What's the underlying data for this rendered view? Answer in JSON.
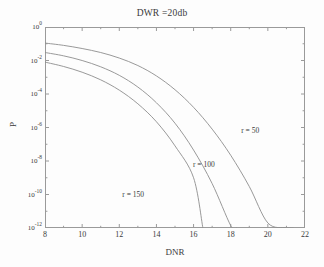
{
  "figure": {
    "title": "DWR =20db",
    "xlabel": "DNR",
    "ylabel": "P",
    "line_color": "#8d8d8d",
    "axis_color": "#9a9a9a",
    "text_color": "#3a3a3a",
    "background": "#fdfdfd"
  },
  "axis": {
    "x_ticks": [
      "8",
      "10",
      "12",
      "14",
      "16",
      "18",
      "20",
      "22"
    ],
    "y_ticks": [
      {
        "mantissa": "10",
        "exponent": "0"
      },
      {
        "mantissa": "10",
        "exponent": "-2"
      },
      {
        "mantissa": "10",
        "exponent": "-4"
      },
      {
        "mantissa": "10",
        "exponent": "-6"
      },
      {
        "mantissa": "10",
        "exponent": "-8"
      },
      {
        "mantissa": "10",
        "exponent": "-10"
      },
      {
        "mantissa": "10",
        "exponent": "-12"
      }
    ]
  },
  "annotations": [
    {
      "text": "r = 50",
      "x": 19.05,
      "y_exp": -6.15
    },
    {
      "text": "r = 100",
      "x": 16.55,
      "y_exp": -8.15
    },
    {
      "text": "r = 150",
      "x": 12.75,
      "y_exp": -9.95
    }
  ],
  "chart_data": {
    "type": "line",
    "title": "DWR =20db",
    "xlabel": "DNR",
    "ylabel": "P",
    "xlim": [
      8,
      22
    ],
    "ylim": [
      1e-12,
      1
    ],
    "yscale": "log",
    "xscale": "linear",
    "grid": false,
    "legend": "inline-annotations",
    "x_ticks": [
      8,
      10,
      12,
      14,
      16,
      18,
      20,
      22
    ],
    "y_ticks": [
      1.0,
      0.01,
      0.0001,
      1e-06,
      1e-08,
      1e-10,
      1e-12
    ],
    "series": [
      {
        "name": "r = 50",
        "label": "r = 50",
        "x": [
          8,
          9,
          10,
          11,
          12,
          13,
          14,
          15,
          16,
          17,
          18,
          19,
          20,
          21,
          21.35
        ],
        "y": [
          0.11,
          0.08,
          0.052,
          0.03,
          0.014,
          0.005,
          0.0012,
          0.00018,
          1.6e-05,
          8e-07,
          2.2e-08,
          3e-10,
          2e-12,
          1.05e-12,
          1e-12
        ]
      },
      {
        "name": "r = 100",
        "label": "r = 100",
        "x": [
          8,
          9,
          10,
          11,
          12,
          13,
          14,
          15,
          16,
          17,
          18,
          18.3
        ],
        "y": [
          0.03,
          0.019,
          0.01,
          0.0042,
          0.0013,
          0.00026,
          3e-05,
          1.8e-06,
          4.5e-08,
          4.5e-10,
          1.4e-12,
          1e-12
        ]
      },
      {
        "name": "r = 150",
        "label": "r = 150",
        "x": [
          8,
          9,
          10,
          11,
          12,
          13,
          14,
          15,
          16,
          16.5
        ],
        "y": [
          0.008,
          0.0044,
          0.002,
          0.0007,
          0.00017,
          2.6e-05,
          2.2e-06,
          8e-08,
          1e-09,
          1e-12
        ]
      }
    ]
  }
}
